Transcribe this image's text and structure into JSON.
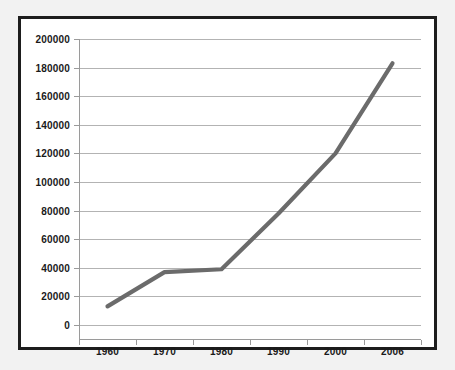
{
  "figure": {
    "background_color": "#ffffff",
    "page_background_color": "#f2f2f2",
    "border_color": "#1d1d1d"
  },
  "chart_data": {
    "type": "line",
    "title": "",
    "subtitle": "",
    "xlabel": "",
    "ylabel": "",
    "categories": [
      "1960",
      "1970",
      "1980",
      "1990",
      "2000",
      "2006"
    ],
    "values": [
      13000,
      37000,
      39000,
      78000,
      120000,
      183000
    ],
    "series": [
      {
        "name": "",
        "values": [
          13000,
          37000,
          39000,
          78000,
          120000,
          183000
        ],
        "color": "#6b6b6b"
      }
    ],
    "ylim": [
      0,
      200000
    ],
    "yticks": [
      0,
      20000,
      40000,
      60000,
      80000,
      100000,
      120000,
      140000,
      160000,
      180000,
      200000
    ],
    "ytick_labels": [
      "0",
      "20000",
      "40000",
      "60000",
      "80000",
      "100000",
      "120000",
      "140000",
      "160000",
      "180000",
      "200000"
    ],
    "xtick_labels": [
      "1960",
      "1970",
      "1980",
      "1990",
      "2000",
      "2006"
    ],
    "grid": {
      "horizontal": true,
      "vertical": false,
      "color": "#b3b3b3"
    },
    "legend": {
      "visible": false,
      "position": "none",
      "entries": []
    },
    "annotations": []
  }
}
